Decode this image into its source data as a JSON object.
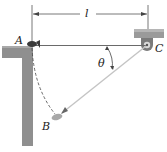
{
  "diagram": {
    "type": "mechanics-figure",
    "labels": {
      "length": "l",
      "point_a": "A",
      "point_b": "B",
      "point_c": "C",
      "angle": "θ"
    },
    "colors": {
      "structure": "#8f8f8f",
      "structure_dark": "#6e6e6e",
      "rope": "#b8b8b8",
      "line": "#3a3a3a",
      "text": "#222222"
    }
  }
}
